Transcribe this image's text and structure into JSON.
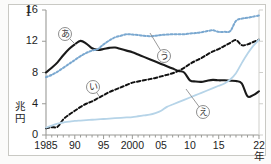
{
  "figure": {
    "number": "I",
    "y_axis_unit": "兆円",
    "x_axis_unit": "年"
  },
  "chart_data": {
    "type": "line",
    "title": "",
    "xlabel": "年",
    "ylabel": "兆円",
    "ylim": [
      0,
      16
    ],
    "xlim": [
      1985,
      2022
    ],
    "grid": false,
    "legend_position": "inline-annotations",
    "yticks": [
      "0",
      "4",
      "8",
      "12",
      "16"
    ],
    "ytick_values": [
      0,
      4,
      8,
      12,
      16
    ],
    "xticks": [
      "1985",
      "90",
      "95",
      "2000",
      "05",
      "10",
      "15",
      "22"
    ],
    "xtick_values": [
      1985,
      1990,
      1995,
      2000,
      2005,
      2010,
      2015,
      2022
    ],
    "x": [
      1985,
      1986,
      1987,
      1988,
      1989,
      1990,
      1991,
      1992,
      1993,
      1994,
      1995,
      1996,
      1997,
      1998,
      1999,
      2000,
      2001,
      2002,
      2003,
      2004,
      2005,
      2006,
      2007,
      2008,
      2009,
      2010,
      2011,
      2012,
      2013,
      2014,
      2015,
      2016,
      2017,
      2018,
      2019,
      2020,
      2021,
      2022
    ],
    "series": [
      {
        "name": "あ",
        "label": "あ",
        "color": "#1a1a1a",
        "style": "solid",
        "width": 2.1,
        "values": [
          8.0,
          8.6,
          9.3,
          10.2,
          11.0,
          11.6,
          12.05,
          11.7,
          11.1,
          10.9,
          11.0,
          11.15,
          11.2,
          11.0,
          10.8,
          10.6,
          10.3,
          10.0,
          9.7,
          9.4,
          9.1,
          8.8,
          8.5,
          8.2,
          8.0,
          7.0,
          6.85,
          6.8,
          6.95,
          7.05,
          7.0,
          7.0,
          6.95,
          6.9,
          6.6,
          4.95,
          5.1,
          5.6
        ]
      },
      {
        "name": "い",
        "label": "い",
        "color": "#111111",
        "style": "dashed",
        "width": 2.0,
        "values": [
          0.85,
          1.0,
          1.05,
          2.0,
          2.6,
          3.1,
          3.6,
          4.0,
          4.3,
          4.7,
          5.1,
          5.5,
          5.8,
          6.1,
          6.4,
          6.7,
          6.85,
          7.0,
          7.15,
          7.3,
          7.5,
          7.7,
          7.9,
          8.2,
          8.6,
          9.1,
          9.5,
          9.85,
          10.3,
          10.7,
          11.0,
          11.4,
          11.8,
          12.15,
          11.5,
          11.6,
          11.9,
          12.2
        ]
      },
      {
        "name": "う",
        "label": "う",
        "color": "#7aa8d0",
        "style": "dotted",
        "width": 2.0,
        "values": [
          7.4,
          7.7,
          8.1,
          8.6,
          9.1,
          9.6,
          10.1,
          10.5,
          10.8,
          11.0,
          11.6,
          12.1,
          12.5,
          12.7,
          12.9,
          12.85,
          12.8,
          12.7,
          12.65,
          12.7,
          12.8,
          12.85,
          12.9,
          12.9,
          12.9,
          13.0,
          13.05,
          13.15,
          13.3,
          13.4,
          13.2,
          13.2,
          13.3,
          14.6,
          14.9,
          15.0,
          15.15,
          15.3
        ]
      },
      {
        "name": "え",
        "label": "え",
        "color": "#b6d4e8",
        "style": "solid",
        "width": 1.8,
        "values": [
          0.95,
          1.2,
          1.45,
          1.6,
          1.7,
          1.8,
          1.85,
          1.9,
          1.95,
          2.0,
          2.05,
          2.1,
          2.15,
          2.2,
          2.25,
          2.3,
          2.4,
          2.5,
          2.6,
          2.8,
          3.1,
          3.6,
          3.9,
          4.2,
          4.5,
          4.8,
          5.1,
          5.4,
          5.7,
          6.0,
          6.3,
          6.6,
          7.1,
          7.9,
          9.2,
          10.4,
          11.4,
          12.2
        ]
      }
    ],
    "annotations": [
      {
        "label": "あ",
        "x_px": 58,
        "y_px": 27,
        "pointer_to_x_px": 76,
        "pointer_to_y_px": 45
      },
      {
        "label": "い",
        "x_px": 86,
        "y_px": 80,
        "pointer_to_x_px": 99,
        "pointer_to_y_px": 96
      },
      {
        "label": "う",
        "x_px": 157,
        "y_px": 49,
        "pointer_to_x_px": 150,
        "pointer_to_y_px": 33
      },
      {
        "label": "え",
        "x_px": 196,
        "y_px": 105,
        "pointer_to_x_px": 186,
        "pointer_to_y_px": 89
      }
    ]
  }
}
